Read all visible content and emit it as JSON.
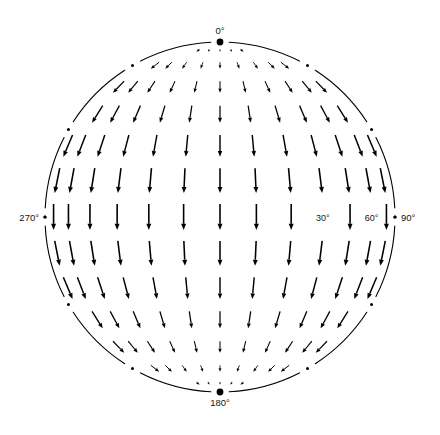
{
  "figure": {
    "type": "vector-field-sphere",
    "projection": "orthographic",
    "title": "",
    "background_color": "#ffffff",
    "ink_color": "#000000"
  },
  "labels": {
    "top": "0°",
    "bottom": "180°",
    "left": "270°",
    "right": "90°",
    "equator_inner_a": "30°",
    "equator_inner_b": "60°"
  },
  "geometry": {
    "center_x": 220,
    "center_y": 217,
    "radius": 175,
    "limb_gap_deg": 3.0,
    "limb_tick_step_deg": 30
  },
  "chart_data": {
    "type": "scatter",
    "title": "",
    "xlabel": "",
    "ylabel": "",
    "colatitude_deg": [
      6,
      18,
      30,
      42,
      54,
      66,
      78,
      90,
      102,
      114,
      126,
      138,
      150,
      162,
      174
    ],
    "longitude_deg": [
      -84,
      -72,
      -60,
      -48,
      -36,
      -24,
      -12,
      0,
      12,
      24,
      36,
      48,
      60,
      72,
      84
    ],
    "magnitude_rule": "sin(colatitude)",
    "max_arrow_px": 26,
    "legend": [],
    "grid": false,
    "annotations": [
      {
        "text": "0°",
        "position": "top-pole"
      },
      {
        "text": "180°",
        "position": "bottom-pole"
      },
      {
        "text": "270°",
        "position": "left-limb"
      },
      {
        "text": "90°",
        "position": "right-limb"
      },
      {
        "text": "30°",
        "position": "equator-lon-30"
      },
      {
        "text": "60°",
        "position": "equator-lon-60"
      }
    ]
  }
}
